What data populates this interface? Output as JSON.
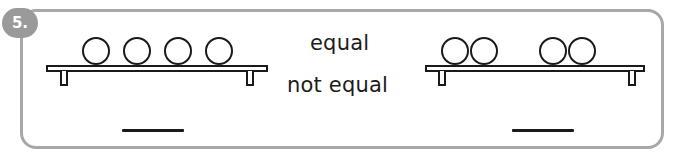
{
  "question": {
    "number_label": "5.",
    "type": "equal-or-not-equal-comparison"
  },
  "colors": {
    "box_border": "#a8a8a8",
    "badge_background": "#9a9a9a",
    "badge_text": "#ffffff",
    "ink": "#1a1a1a",
    "page_background": "#ffffff"
  },
  "options": {
    "equal_label": "equal",
    "not_equal_label": "not equal"
  },
  "groups": [
    {
      "id": "left-group",
      "circle_count": 4,
      "arrangement": "evenly-spaced",
      "circles": [
        {
          "cx": 96,
          "cy": 51,
          "r": 14
        },
        {
          "cx": 137,
          "cy": 51,
          "r": 14
        },
        {
          "cx": 178,
          "cy": 51,
          "r": 14
        },
        {
          "cx": 219,
          "cy": 51,
          "r": 14
        }
      ],
      "shelf": {
        "x": 46,
        "y": 65,
        "width": 222
      },
      "legs": [
        {
          "x": 14
        },
        {
          "x": 200
        }
      ],
      "answer_line": {
        "x": 122,
        "y": 129,
        "width": 62
      }
    },
    {
      "id": "right-group",
      "circle_count": 4,
      "arrangement": "two-pairs-with-gap",
      "circles": [
        {
          "cx": 455,
          "cy": 51,
          "r": 14
        },
        {
          "cx": 484,
          "cy": 51,
          "r": 14
        },
        {
          "cx": 553,
          "cy": 51,
          "r": 14
        },
        {
          "cx": 582,
          "cy": 51,
          "r": 14
        }
      ],
      "shelf": {
        "x": 425,
        "y": 65,
        "width": 220
      },
      "legs": [
        {
          "x": 13
        },
        {
          "x": 203
        }
      ],
      "answer_line": {
        "x": 512,
        "y": 129,
        "width": 62
      }
    }
  ]
}
